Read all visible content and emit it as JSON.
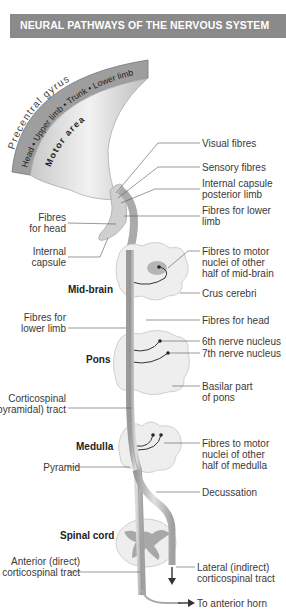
{
  "header": {
    "title": "NEURAL PATHWAYS OF THE NERVOUS SYSTEM"
  },
  "cortex": {
    "gyrus_label": "Precentral gyrus",
    "body_map": "Head • Upper limb • Trunk • Lower limb",
    "area_label": "Motor area"
  },
  "levels": {
    "midbrain": "Mid-brain",
    "pons": "Pons",
    "medulla": "Medulla",
    "spinal_cord": "Spinal cord"
  },
  "labels_right": {
    "visual_fibres": "Visual fibres",
    "sensory_fibres": "Sensory fibres",
    "internal_capsule_posterior_1": "Internal capsule",
    "internal_capsule_posterior_2": "posterior limb",
    "fibres_lower_limb_1": "Fibres for lower",
    "fibres_lower_limb_2": "limb",
    "motor_nuclei_midbrain_1": "Fibres to motor",
    "motor_nuclei_midbrain_2": "nuclei of other",
    "motor_nuclei_midbrain_3": "half of mid-brain",
    "crus_cerebri": "Crus cerebri",
    "fibres_for_head": "Fibres for head",
    "sixth_nerve": "6th nerve nucleus",
    "seventh_nerve": "7th nerve nucleus",
    "basilar_pons_1": "Basilar part",
    "basilar_pons_2": "of pons",
    "motor_nuclei_medulla_1": "Fibres to motor",
    "motor_nuclei_medulla_2": "nuclei of other",
    "motor_nuclei_medulla_3": "half of medulla",
    "decussation": "Decussation",
    "lateral_tract_1": "Lateral (indirect)",
    "lateral_tract_2": "corticospinal tract",
    "anterior_horn": "To anterior horn"
  },
  "labels_left": {
    "fibres_head_1": "Fibres",
    "fibres_head_2": "for head",
    "internal_capsule_1": "Internal",
    "internal_capsule_2": "capsule",
    "fibres_lower_limb_1": "Fibres for",
    "fibres_lower_limb_2": "lower limb",
    "corticospinal_1": "Corticospinal",
    "corticospinal_2": "(pyramidal) tract",
    "pyramid": "Pyramid",
    "anterior_tract_1": "Anterior (direct)",
    "anterior_tract_2": "corticospinal tract"
  },
  "colors": {
    "header_bg": "#8a8a8a",
    "cortex_band": "#9a9a9a",
    "tract": "#b8b8b8",
    "brainstem": "#ececec",
    "grey_matter": "#a8a8a8"
  }
}
